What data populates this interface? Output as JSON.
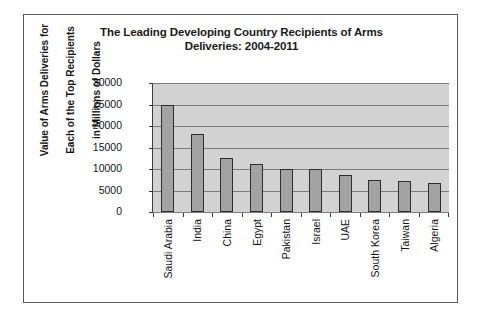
{
  "chart_data": {
    "type": "bar",
    "title": "The Leading Developing Country Recipients of Arms Deliveries: 2004-2011",
    "title_line1": "The Leading Developing Country Recipients of Arms",
    "title_line2": "Deliveries: 2004-2011",
    "xlabel": "",
    "ylabel": "Value of Arms Deliveries for Each of the Top Recipients in Millions of Dollars",
    "ylabel_line1": "Value of Arms Deliveries for",
    "ylabel_line2": "Each of the Top Recipients",
    "ylabel_line3": "in Millions of Dollars",
    "categories": [
      "Saudi Arabia",
      "India",
      "China",
      "Egypt",
      "Pakistan",
      "Israel",
      "UAE",
      "South Korea",
      "Taiwan",
      "Algeria"
    ],
    "values": [
      24800,
      18200,
      12600,
      11200,
      10100,
      10000,
      8500,
      7400,
      7200,
      6700
    ],
    "ylim": [
      0,
      30000
    ],
    "yticks": [
      30000,
      25000,
      20000,
      15000,
      10000,
      5000,
      0
    ],
    "ytick_labels": [
      "30000",
      "25000",
      "20000",
      "15000",
      "10000",
      "5000",
      "0"
    ],
    "grid": true,
    "legend": false,
    "legend_position": "none",
    "colors": {
      "bar_fill": "#a3a3a3",
      "bar_outline": "#2e2e2e",
      "plot_background": "#d2d2d2",
      "gridline": "#7d7d7d",
      "axis": "#3d3d3d",
      "text": "#141414",
      "frame": "#58595b",
      "page_background": "#ffffff"
    }
  }
}
